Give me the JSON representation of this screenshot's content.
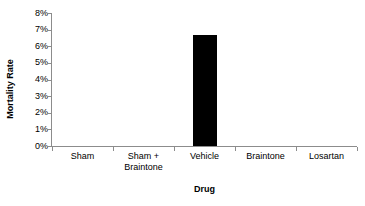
{
  "chart_data": {
    "type": "bar",
    "title": "",
    "subtitle": "",
    "xlabel": "Drug",
    "ylabel": "Mortality Rate",
    "categories": [
      "Sham",
      "Sham +\nBraintone",
      "Vehicle",
      "Braintone",
      "Losartan"
    ],
    "values": [
      0,
      0,
      6.7,
      0,
      0
    ],
    "ylim": [
      0,
      8
    ],
    "ytick_values": [
      0,
      1,
      2,
      3,
      4,
      5,
      6,
      7,
      8
    ],
    "ytick_labels": [
      "0%",
      "1%",
      "2%",
      "3%",
      "4%",
      "5%",
      "6%",
      "7%",
      "8%"
    ],
    "value_unit": "%",
    "grid": false,
    "legend": null,
    "legend_position": "none",
    "bar_color": "#000000",
    "axis_color": "#8c8c8c",
    "background_color": "#ffffff"
  }
}
